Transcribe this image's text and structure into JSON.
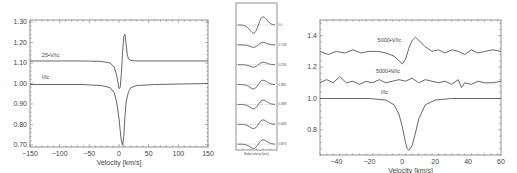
{
  "chart_data": [
    {
      "id": "left-panel",
      "type": "line",
      "title": "",
      "xlabel": "Velocity [km/s]",
      "ylabel": "",
      "xlim": [
        -150,
        150
      ],
      "ylim": [
        0.69,
        1.31
      ],
      "xticks": [
        -150,
        -100,
        -50,
        0,
        50,
        100,
        150
      ],
      "xtick_labels": [
        "−150",
        "−100",
        "−50",
        "0",
        "50",
        "100",
        "150"
      ],
      "yticks": [
        0.7,
        0.8,
        0.9,
        1.0,
        1.1,
        1.2,
        1.3
      ],
      "ytick_labels": [
        "0.70",
        "0.80",
        "0.90",
        "1.00",
        "1.10",
        "1.20",
        "1.30"
      ],
      "grid": false,
      "series": [
        {
          "name": "25•V/Ic",
          "label_pos": [
            -130,
            1.13
          ],
          "x": [
            -150,
            -60,
            -30,
            -15,
            -8,
            -4,
            0,
            2,
            4,
            6,
            8,
            10,
            12,
            14,
            16,
            20,
            30,
            60,
            150
          ],
          "y": [
            1.11,
            1.11,
            1.108,
            1.1,
            1.08,
            1.04,
            0.975,
            0.98,
            1.05,
            1.15,
            1.23,
            1.24,
            1.19,
            1.14,
            1.12,
            1.112,
            1.11,
            1.11,
            1.11
          ]
        },
        {
          "name": "I/Ic",
          "label_pos": [
            -130,
            1.02
          ],
          "x": [
            -150,
            -60,
            -30,
            -15,
            -8,
            -4,
            0,
            2,
            4,
            6,
            8,
            10,
            12,
            16,
            20,
            30,
            60,
            150
          ],
          "y": [
            0.995,
            0.995,
            0.99,
            0.98,
            0.955,
            0.91,
            0.83,
            0.77,
            0.72,
            0.7,
            0.74,
            0.84,
            0.91,
            0.96,
            0.98,
            0.99,
            0.995,
            1.0
          ]
        }
      ],
      "reference_line": {
        "x": 7,
        "style": "dashed-short"
      }
    },
    {
      "id": "inset-panel",
      "type": "line",
      "title": "",
      "xlabel": "Radial velocity (km/s)",
      "ylabel": "",
      "grid": false,
      "note": "Stacked Stokes V profiles at different rotational phases; labels too small to read precisely",
      "series": [
        {
          "name": "0.0",
          "offset": 0
        },
        {
          "name": "0.1758",
          "offset": 1
        },
        {
          "name": "0.2765",
          "offset": 2
        },
        {
          "name": "0.3881",
          "offset": 3
        },
        {
          "name": "0.4889",
          "offset": 4
        },
        {
          "name": "0.6036",
          "offset": 5
        },
        {
          "name": "0.6974",
          "offset": 6
        }
      ]
    },
    {
      "id": "right-panel",
      "type": "line",
      "title": "",
      "xlabel": "Velocity [km/s]",
      "ylabel": "",
      "xlim": [
        -50,
        60
      ],
      "ylim": [
        0.64,
        1.5
      ],
      "xticks": [
        -40,
        -20,
        0,
        20,
        40,
        60
      ],
      "xtick_labels": [
        "−40",
        "−20",
        "0",
        "20",
        "40",
        "60"
      ],
      "yticks": [
        0.8,
        1.0,
        1.2,
        1.4
      ],
      "ytick_labels": [
        "0.8",
        "1.0",
        "1.2",
        "1.4"
      ],
      "grid": false,
      "series": [
        {
          "name": "5000•V/Ic",
          "label_pos": [
            -15,
            1.36
          ],
          "x": [
            -50,
            -45,
            -40,
            -35,
            -30,
            -25,
            -20,
            -15,
            -10,
            -5,
            -2,
            0,
            2,
            4,
            6,
            8,
            10,
            14,
            18,
            22,
            26,
            30,
            34,
            38,
            42,
            46,
            50,
            55,
            60
          ],
          "y": [
            1.3,
            1.28,
            1.3,
            1.29,
            1.31,
            1.29,
            1.3,
            1.3,
            1.29,
            1.27,
            1.24,
            1.22,
            1.25,
            1.32,
            1.37,
            1.39,
            1.37,
            1.33,
            1.3,
            1.31,
            1.29,
            1.31,
            1.3,
            1.28,
            1.31,
            1.29,
            1.3,
            1.31,
            1.3
          ]
        },
        {
          "name": "5000•N/Ic",
          "label_pos": [
            -16,
            1.16
          ],
          "x": [
            -50,
            -46,
            -42,
            -38,
            -34,
            -30,
            -26,
            -22,
            -18,
            -14,
            -10,
            -6,
            -2,
            2,
            6,
            10,
            14,
            18,
            22,
            26,
            30,
            34,
            36,
            38,
            42,
            46,
            50,
            55,
            60
          ],
          "y": [
            1.1,
            1.12,
            1.1,
            1.14,
            1.1,
            1.11,
            1.09,
            1.11,
            1.1,
            1.12,
            1.1,
            1.11,
            1.12,
            1.11,
            1.13,
            1.1,
            1.12,
            1.11,
            1.1,
            1.11,
            1.09,
            1.12,
            1.07,
            1.1,
            1.09,
            1.11,
            1.1,
            1.1,
            1.11
          ]
        },
        {
          "name": "I/Ic",
          "label_pos": [
            -13,
            1.03
          ],
          "x": [
            -50,
            -20,
            -10,
            -5,
            -2,
            0,
            2,
            3,
            4,
            6,
            8,
            10,
            14,
            20,
            30,
            60
          ],
          "y": [
            1.0,
            1.0,
            0.99,
            0.96,
            0.9,
            0.82,
            0.72,
            0.68,
            0.67,
            0.7,
            0.78,
            0.87,
            0.96,
            0.99,
            1.0,
            1.0
          ]
        }
      ]
    }
  ]
}
